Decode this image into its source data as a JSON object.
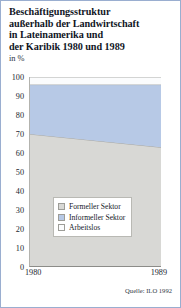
{
  "figure": {
    "title": "Beschäftigungsstruktur\naußerhalb der Landwirtschaft\nin Lateinamerika und\nder Karibik 1980 und 1989",
    "subtitle": "in %",
    "source": "Quelle: ILO 1992",
    "border_color": "#9aaed0"
  },
  "chart_data": {
    "type": "area",
    "stacked": true,
    "title": "Beschäftigungsstruktur außerhalb der Landwirtschaft in Lateinamerika und der Karibik 1980 und 1989",
    "subtitle": "in %",
    "xlabel": "",
    "ylabel": "in %",
    "x": [
      "1980",
      "1989"
    ],
    "categories": [
      "1980",
      "1989"
    ],
    "xticklabels": [
      "1980",
      "1989"
    ],
    "yticklabels": [
      "0",
      "10",
      "20",
      "30",
      "40",
      "50",
      "60",
      "70",
      "80",
      "90",
      "100"
    ],
    "yticks": [
      0,
      10,
      20,
      30,
      40,
      50,
      60,
      70,
      80,
      90,
      100
    ],
    "ylim": [
      0,
      100
    ],
    "grid": false,
    "legend_position": "center",
    "series": [
      {
        "name": "Formeller Sektor",
        "color": "#d8d8d5",
        "values": [
          70,
          63
        ],
        "cumulative_top": [
          70,
          63
        ]
      },
      {
        "name": "Informeller Sektor",
        "color": "#b7c9e6",
        "values": [
          26,
          33
        ],
        "cumulative_top": [
          96,
          96
        ]
      },
      {
        "name": "Arbeitslos",
        "color": "#fbfcfd",
        "values": [
          4,
          4
        ],
        "cumulative_top": [
          100,
          100
        ]
      }
    ],
    "legend": [
      {
        "label": "Formeller Sektor",
        "color": "#d8d8d5"
      },
      {
        "label": "Informeller Sektor",
        "color": "#b7c9e6"
      },
      {
        "label": "Arbeitslos",
        "color": "#fbfcfd"
      }
    ],
    "source": "Quelle: ILO 1992"
  }
}
